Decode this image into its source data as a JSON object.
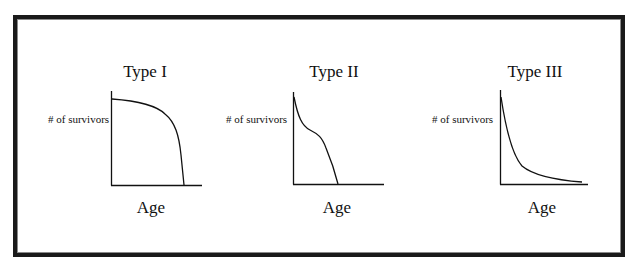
{
  "diagram": {
    "panels": [
      {
        "title": "Type I",
        "ylabel": "# of survivors",
        "xlabel": "Age",
        "curve": "late-loss: flat then steep drop"
      },
      {
        "title": "Type II",
        "ylabel": "# of survivors",
        "xlabel": "Age",
        "curve": "steady decline with shoulder"
      },
      {
        "title": "Type III",
        "ylabel": "# of survivors",
        "xlabel": "Age",
        "curve": "early-loss: steep drop then long tail"
      }
    ],
    "colors": {
      "frame": "#1a1a1a",
      "frame_inner": "#8a8a8a",
      "line": "#111111",
      "background": "#ffffff"
    }
  }
}
